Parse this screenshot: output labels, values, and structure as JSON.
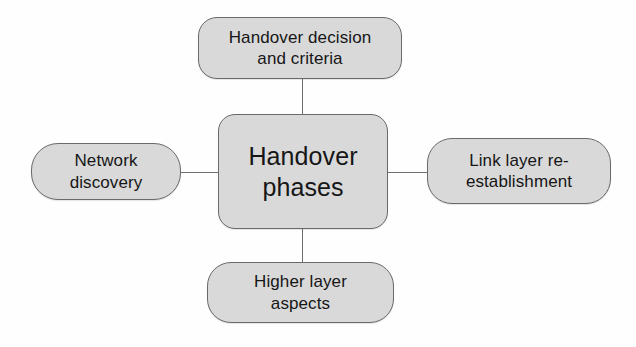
{
  "diagram": {
    "title": "Handover phases",
    "type": "mind-map",
    "colors": {
      "node_fill": "#d9d9d9",
      "node_border": "#6a6a6a",
      "connector": "#6e6e6e",
      "text": "#161616",
      "background": "#fefefe"
    },
    "center": {
      "id": "handover-phases",
      "label": "Handover\nphases"
    },
    "branches": [
      {
        "id": "handover-decision-and-criteria",
        "position": "top",
        "label": "Handover decision\nand criteria"
      },
      {
        "id": "network-discovery",
        "position": "left",
        "label": "Network\ndiscovery"
      },
      {
        "id": "link-layer-re-establishment",
        "position": "right",
        "label": "Link layer re-\nestablishment"
      },
      {
        "id": "higher-layer-aspects",
        "position": "bottom",
        "label": "Higher layer\naspects"
      }
    ]
  }
}
